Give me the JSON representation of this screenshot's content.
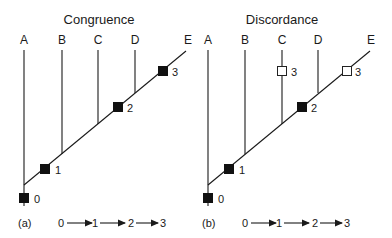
{
  "panels": [
    {
      "id": "a",
      "title": "Congruence",
      "caption": "(a)",
      "taxa": [
        "A",
        "B",
        "C",
        "D",
        "E"
      ],
      "markers": [
        {
          "label": "0",
          "style": "filled",
          "position": "root"
        },
        {
          "label": "1",
          "style": "filled",
          "position": "internal-branch-below-B"
        },
        {
          "label": "2",
          "style": "filled",
          "position": "internal-branch-below-D"
        },
        {
          "label": "3",
          "style": "filled",
          "position": "branch-to-E"
        }
      ],
      "sequence": [
        "0",
        "1",
        "2",
        "3"
      ]
    },
    {
      "id": "b",
      "title": "Discordance",
      "caption": "(b)",
      "taxa": [
        "A",
        "B",
        "C",
        "D",
        "E"
      ],
      "markers": [
        {
          "label": "0",
          "style": "filled",
          "position": "root"
        },
        {
          "label": "1",
          "style": "filled",
          "position": "internal-branch-below-B"
        },
        {
          "label": "2",
          "style": "filled",
          "position": "internal-branch-below-D"
        },
        {
          "label": "3",
          "style": "open",
          "position": "branch-to-C"
        },
        {
          "label": "3",
          "style": "open",
          "position": "branch-to-E"
        }
      ],
      "sequence": [
        "0",
        "1",
        "2",
        "3"
      ]
    }
  ]
}
